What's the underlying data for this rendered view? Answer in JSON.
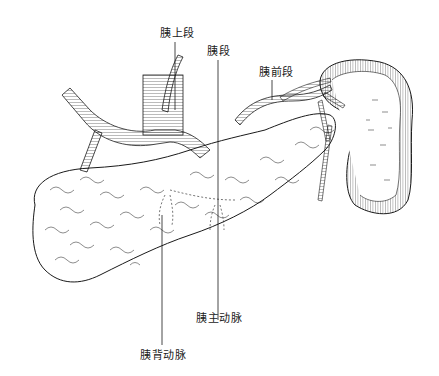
{
  "figure": {
    "labels": {
      "superior_segment": "胰上段",
      "segment": "胰段",
      "anterior_segment": "胰前段",
      "main_artery": "胰主动脉",
      "dorsal_artery": "胰背动脉"
    },
    "colors": {
      "line": "#1a1a1a",
      "background": "#ffffff"
    }
  }
}
